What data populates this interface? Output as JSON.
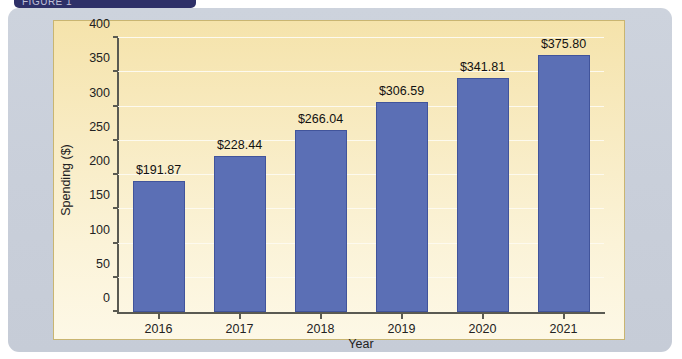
{
  "header": {
    "tab_label": "FIGURE 1"
  },
  "chart_data": {
    "type": "bar",
    "title": "",
    "categories": [
      "2016",
      "2017",
      "2018",
      "2019",
      "2020",
      "2021"
    ],
    "values": [
      191.87,
      228.44,
      266.04,
      306.59,
      341.81,
      375.8
    ],
    "data_labels": [
      "$191.87",
      "$228.44",
      "$266.04",
      "$306.59",
      "$341.81",
      "$375.80"
    ],
    "xlabel": "Year",
    "ylabel": "Spending ($)",
    "ylim": [
      0,
      400
    ],
    "yticks": [
      0,
      50,
      100,
      150,
      200,
      250,
      300,
      350,
      400
    ],
    "ytick_labels": [
      "0",
      "50",
      "100",
      "150",
      "200",
      "250",
      "300",
      "350",
      "400"
    ],
    "grid": true,
    "grid_axis": "y",
    "legend": false,
    "bar_color": "#5b6fb5",
    "bar_edge_color": "#41549b",
    "plot_background": "#f7e8b8",
    "frame_color": "#c9cfda"
  }
}
